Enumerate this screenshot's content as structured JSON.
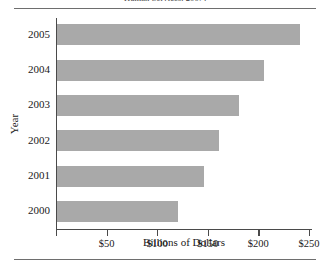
{
  "figure": {
    "title_clipped": "Human Services, 2007)",
    "background": "#ffffff",
    "bar_color": "#a9a9a9",
    "axis_color": "#4a4a4a",
    "rule_color": "#6e6e6e"
  },
  "chart_data": {
    "type": "bar",
    "orientation": "horizontal",
    "title": "Human Services, 2007)",
    "xlabel": "Billions of Dollars",
    "ylabel": "Year",
    "categories": [
      "2005",
      "2004",
      "2003",
      "2002",
      "2001",
      "2000"
    ],
    "values": [
      240,
      205,
      180,
      160,
      145,
      120
    ],
    "xlim": [
      0,
      253
    ],
    "xticks": [
      0,
      50,
      100,
      150,
      200,
      250
    ],
    "xticklabels": [
      "",
      "$50",
      "$100",
      "$150",
      "$200",
      "$250"
    ],
    "grid": false,
    "legend": null,
    "series": [
      {
        "name": "Billions of Dollars",
        "values": [
          240,
          205,
          180,
          160,
          145,
          120
        ]
      }
    ]
  }
}
